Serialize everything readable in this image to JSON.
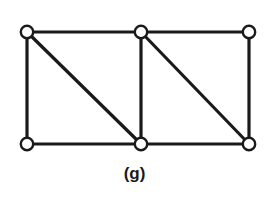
{
  "figure": {
    "caption": "(g)",
    "kind": "undirected-graph-diagram",
    "canvas": {
      "width": 269,
      "height": 198
    },
    "colors": {
      "background": "#ffffff",
      "stroke": "#1a1a1a",
      "vertex_fill": "#ffffff",
      "caption": "#1a1a1a"
    },
    "style": {
      "edge_stroke_width": 3.2,
      "vertex_stroke_width": 2.4,
      "vertex_radius": 6.2
    }
  },
  "graph": {
    "vertex_count": 6,
    "edge_count": 9,
    "vertices": [
      {
        "id": "v1",
        "label": "",
        "role": "top-left",
        "x": 27,
        "y": 32,
        "degree": 3
      },
      {
        "id": "v2",
        "label": "",
        "role": "top-middle",
        "x": 141,
        "y": 32,
        "degree": 4
      },
      {
        "id": "v3",
        "label": "",
        "role": "top-right",
        "x": 249,
        "y": 32,
        "degree": 2
      },
      {
        "id": "v4",
        "label": "",
        "role": "bottom-left",
        "x": 27,
        "y": 144,
        "degree": 2
      },
      {
        "id": "v5",
        "label": "",
        "role": "bottom-middle",
        "x": 141,
        "y": 144,
        "degree": 4
      },
      {
        "id": "v6",
        "label": "",
        "role": "bottom-right",
        "x": 249,
        "y": 144,
        "degree": 3
      }
    ],
    "edges": [
      {
        "id": "e1",
        "from": "v1",
        "to": "v2",
        "kind": "horizontal",
        "x1": 27,
        "y1": 32,
        "x2": 141,
        "y2": 32
      },
      {
        "id": "e2",
        "from": "v2",
        "to": "v3",
        "kind": "horizontal",
        "x1": 141,
        "y1": 32,
        "x2": 249,
        "y2": 32
      },
      {
        "id": "e3",
        "from": "v4",
        "to": "v5",
        "kind": "horizontal",
        "x1": 27,
        "y1": 144,
        "x2": 141,
        "y2": 144
      },
      {
        "id": "e4",
        "from": "v5",
        "to": "v6",
        "kind": "horizontal",
        "x1": 141,
        "y1": 144,
        "x2": 249,
        "y2": 144
      },
      {
        "id": "e5",
        "from": "v1",
        "to": "v4",
        "kind": "vertical",
        "x1": 27,
        "y1": 32,
        "x2": 27,
        "y2": 144
      },
      {
        "id": "e6",
        "from": "v2",
        "to": "v5",
        "kind": "vertical",
        "x1": 141,
        "y1": 32,
        "x2": 141,
        "y2": 144
      },
      {
        "id": "e7",
        "from": "v3",
        "to": "v6",
        "kind": "vertical",
        "x1": 249,
        "y1": 32,
        "x2": 249,
        "y2": 144
      },
      {
        "id": "e8",
        "from": "v1",
        "to": "v5",
        "kind": "diagonal",
        "x1": 27,
        "y1": 32,
        "x2": 141,
        "y2": 144
      },
      {
        "id": "e9",
        "from": "v2",
        "to": "v6",
        "kind": "diagonal",
        "x1": 141,
        "y1": 32,
        "x2": 249,
        "y2": 144
      }
    ]
  }
}
